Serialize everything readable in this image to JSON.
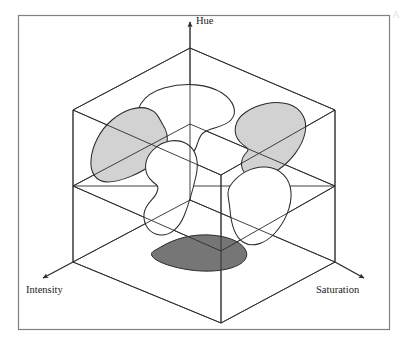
{
  "figure": {
    "title_visible": false,
    "caption_mark": "A",
    "frame": {
      "x": 18,
      "y": 15,
      "width": 372,
      "height": 315,
      "border_color": "#808080",
      "background_color": "#ffffff"
    },
    "axes": [
      {
        "name": "hue-axis",
        "label": "Hue",
        "direction": "up",
        "arrow": true,
        "label_x": 196,
        "label_y": 16
      },
      {
        "name": "intensity-axis",
        "label": "Intensity",
        "direction": "down-left",
        "arrow": true,
        "label_x": 26,
        "label_y": 290
      },
      {
        "name": "saturation-axis",
        "label": "Saturation",
        "direction": "down-right",
        "arrow": true,
        "label_x": 316,
        "label_y": 290
      }
    ],
    "cube": {
      "name": "hsi-wireframe-cube",
      "stroke_color": "#2b2b2b",
      "stroke_width": 0.8,
      "fill": "none",
      "vertices": {
        "top_back": [
          190,
          48
        ],
        "top_left": [
          73,
          110
        ],
        "top_right": [
          335,
          110
        ],
        "top_front": [
          221,
          175
        ],
        "bottom_back": [
          190,
          200
        ],
        "bottom_left": [
          73,
          262
        ],
        "bottom_right": [
          335,
          262
        ],
        "bottom_front": [
          221,
          323
        ]
      }
    },
    "regions": [
      {
        "name": "cluster-lobe-back",
        "role": "blob-lobe",
        "fill": "#ffffff",
        "stroke": "#2b2b2b",
        "shaded": false
      },
      {
        "name": "cluster-lobe-left",
        "role": "blob-lobe",
        "fill": "#d2d2d2",
        "stroke": "#2b2b2b",
        "shaded": true
      },
      {
        "name": "cluster-lobe-right",
        "role": "blob-lobe",
        "fill": "#d2d2d2",
        "stroke": "#2b2b2b",
        "shaded": true
      },
      {
        "name": "cluster-lobe-front-left",
        "role": "blob-lobe",
        "fill": "#ffffff",
        "stroke": "#2b2b2b",
        "shaded": false
      },
      {
        "name": "cluster-lobe-front-right",
        "role": "blob-lobe",
        "fill": "#ffffff",
        "stroke": "#2b2b2b",
        "shaded": false
      },
      {
        "name": "cluster-base-shadow",
        "role": "blob-base-projection",
        "fill": "#767676",
        "stroke": "#2b2b2b",
        "shaded": true
      }
    ],
    "colors": {
      "frame_border": "#808080",
      "line": "#2b2b2b",
      "shade_light": "#d2d2d2",
      "shade_dark": "#767676",
      "background": "#ffffff",
      "text": "#1a1a1a"
    }
  }
}
